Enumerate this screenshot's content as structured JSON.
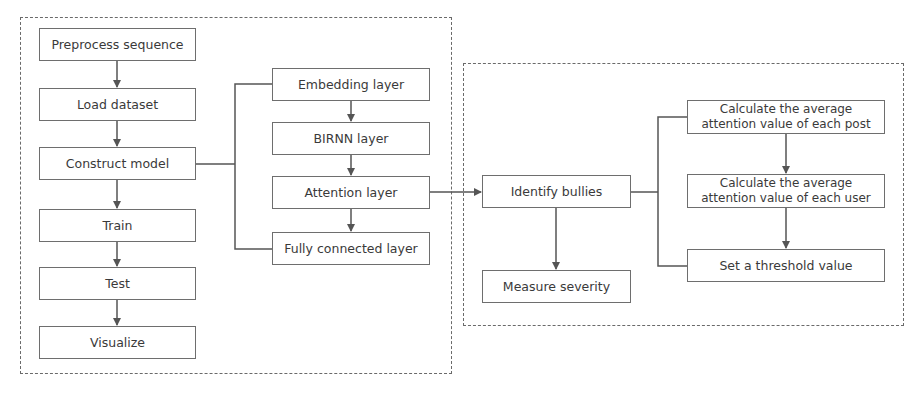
{
  "diagram": {
    "colors": {
      "line": "#555555",
      "box_border": "#6e6e6e",
      "text": "#3a3a3a",
      "frame": "#6a6a6a"
    },
    "left_frame": {
      "steps": [
        {
          "id": "preprocess",
          "label": "Preprocess sequence"
        },
        {
          "id": "load",
          "label": "Load dataset"
        },
        {
          "id": "construct",
          "label": "Construct model"
        },
        {
          "id": "train",
          "label": "Train"
        },
        {
          "id": "test",
          "label": "Test"
        },
        {
          "id": "visualize",
          "label": "Visualize"
        }
      ],
      "model_layers": [
        {
          "id": "embedding",
          "label": "Embedding layer"
        },
        {
          "id": "birnn",
          "label": "BIRNN layer"
        },
        {
          "id": "attention",
          "label": "Attention layer"
        },
        {
          "id": "fc",
          "label": "Fully connected layer"
        }
      ]
    },
    "right_frame": {
      "identify": {
        "label": "Identify bullies"
      },
      "measure": {
        "label": "Measure severity"
      },
      "substeps": [
        {
          "id": "post-avg",
          "label": "Calculate the average attention value of each post"
        },
        {
          "id": "user-avg",
          "label": "Calculate the average attention value of each user"
        },
        {
          "id": "threshold",
          "label": "Set a threshold value"
        }
      ]
    },
    "edges": [
      [
        "Preprocess sequence",
        "Load dataset"
      ],
      [
        "Load dataset",
        "Construct model"
      ],
      [
        "Construct model",
        "Train"
      ],
      [
        "Train",
        "Test"
      ],
      [
        "Test",
        "Visualize"
      ],
      [
        "Construct model",
        "Embedding layer / BIRNN layer / Attention layer / Fully connected layer (bracket)"
      ],
      [
        "Embedding layer",
        "BIRNN layer"
      ],
      [
        "BIRNN layer",
        "Attention layer"
      ],
      [
        "Attention layer",
        "Fully connected layer"
      ],
      [
        "Attention layer",
        "Identify bullies"
      ],
      [
        "Identify bullies",
        "Measure severity"
      ],
      [
        "Identify bullies",
        "substeps (bracket)"
      ],
      [
        "Calculate the average attention value of each post",
        "Calculate the average attention value of each user"
      ],
      [
        "Calculate the average attention value of each user",
        "Set a threshold value"
      ]
    ]
  }
}
